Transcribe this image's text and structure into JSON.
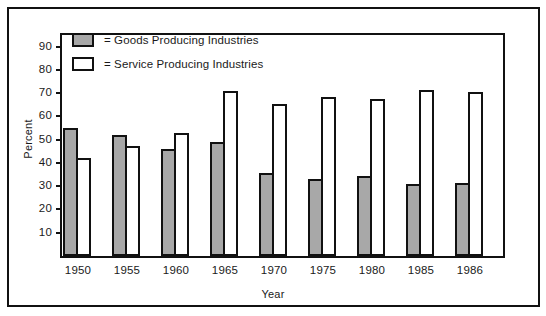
{
  "chart_data": {
    "type": "bar",
    "title": "",
    "xlabel": "Year",
    "ylabel": "Percent",
    "categories": [
      "1950",
      "1955",
      "1960",
      "1965",
      "1970",
      "1975",
      "1980",
      "1985",
      "1986"
    ],
    "series": [
      {
        "name": "= Goods Producing Industries",
        "key": "goods",
        "color": "#a8a8a8",
        "values": [
          55,
          52,
          46,
          49,
          35.5,
          33,
          34.5,
          31,
          31.5
        ]
      },
      {
        "name": "= Service Producing Industries",
        "key": "service",
        "color": "#ffffff",
        "values": [
          42,
          47.5,
          53,
          71,
          65.5,
          68.5,
          67.5,
          71.5,
          70.5
        ]
      }
    ],
    "ylim": [
      0,
      95
    ],
    "yticks": [
      10,
      20,
      30,
      40,
      50,
      60,
      70,
      80,
      90
    ],
    "ytick_labels": [
      "10",
      "20",
      "30",
      "40",
      "50",
      "60",
      "70",
      "80",
      "90"
    ],
    "grid": false,
    "legend_position": "top-left"
  },
  "legend": {
    "items": [
      {
        "label": "= Goods Producing Industries",
        "swatch": "goods"
      },
      {
        "label": "= Service Producing Industries",
        "swatch": "service"
      }
    ]
  },
  "axes": {
    "y_title": "Percent",
    "x_title": "Year"
  }
}
